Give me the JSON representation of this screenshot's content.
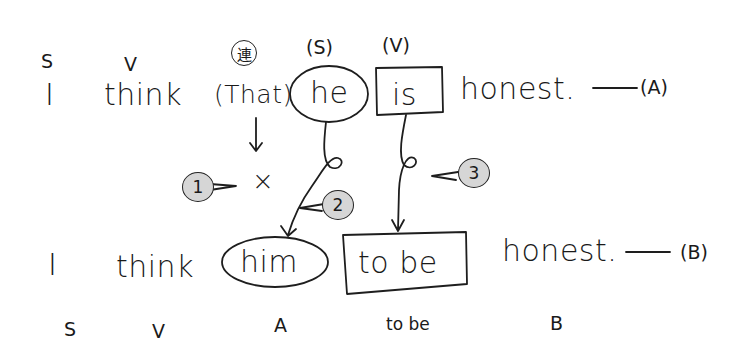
{
  "sentence_a": {
    "label": "(A)",
    "dash": "—",
    "words": {
      "i": "I",
      "think": "think",
      "that": "(That)",
      "he": "he",
      "is": "is",
      "honest": "honest."
    },
    "annotations": {
      "i": "S",
      "think": "V",
      "that_marker": "連",
      "he": "(S)",
      "is": "(V)"
    }
  },
  "sentence_b": {
    "label": "(B)",
    "dash": "—",
    "words": {
      "i": "I",
      "think": "think",
      "him": "him",
      "to_be": "to be",
      "honest": "honest."
    },
    "annotations": {
      "i": "S",
      "think": "V",
      "him": "A",
      "to_be": "to be",
      "honest": "B"
    }
  },
  "deleted_mark": "×",
  "callouts": [
    {
      "number": "1",
      "target": "deleted that"
    },
    {
      "number": "2",
      "target": "he → him"
    },
    {
      "number": "3",
      "target": "is → to be"
    }
  ]
}
